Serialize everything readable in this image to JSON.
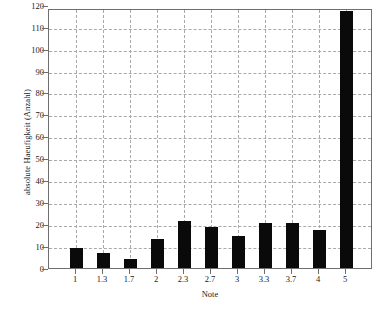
{
  "chart_data": {
    "type": "bar",
    "title": "",
    "xlabel": "Note",
    "ylabel": "absolute Haeufigkeit (Anzahl)",
    "categories": [
      "1",
      "1.3",
      "1.7",
      "2",
      "2.3",
      "2.7",
      "3",
      "3.3",
      "3.7",
      "4",
      "5"
    ],
    "values": [
      9,
      7,
      4,
      13,
      21.5,
      18.5,
      14.5,
      20.5,
      20.5,
      17.5,
      124
    ],
    "ylim": [
      0,
      118.5
    ],
    "yticks": [
      0,
      10,
      20,
      30,
      40,
      50,
      60,
      70,
      80,
      90,
      100,
      110,
      120
    ],
    "ytick_labels": [
      "0",
      "10",
      "20",
      "30",
      "40",
      "50",
      "60",
      "70",
      "80",
      "90",
      "100",
      "110",
      "120"
    ],
    "grid": "both-dashed",
    "legend": "none",
    "bar_color": "#0a0a0a",
    "grid_color": "#a9a9a9",
    "axis_color": "#6e6e6e",
    "background_color": "#ffffff"
  }
}
